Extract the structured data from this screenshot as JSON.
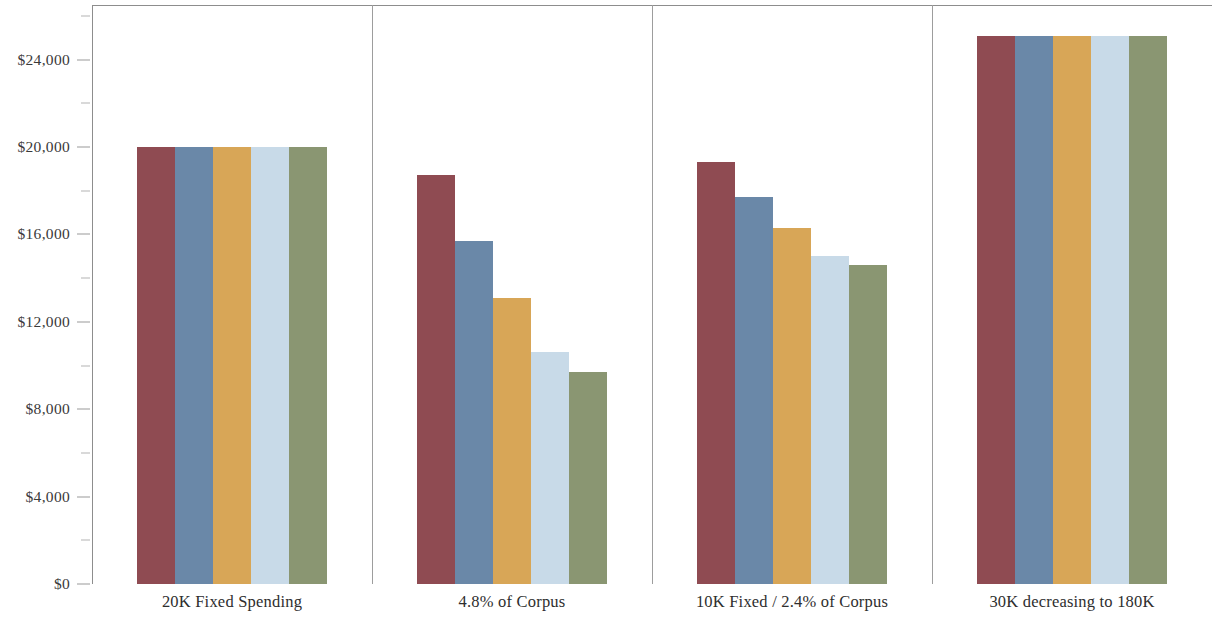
{
  "chart_data": {
    "type": "bar",
    "title": "",
    "subtitle": "",
    "xlabel": "",
    "ylabel": "",
    "categories": [
      "20K Fixed Spending",
      "4.8% of Corpus",
      "10K Fixed / 2.4% of Corpus",
      "30K decreasing to 180K"
    ],
    "series": [
      {
        "name": "Series 1",
        "color": "#8f4b52",
        "values": [
          20000,
          18700,
          19300,
          25100
        ]
      },
      {
        "name": "Series 2",
        "color": "#6a88a8",
        "values": [
          20000,
          15700,
          17700,
          25100
        ]
      },
      {
        "name": "Series 3",
        "color": "#d8a657",
        "values": [
          20000,
          13100,
          16300,
          25100
        ]
      },
      {
        "name": "Series 4",
        "color": "#c8dae8",
        "values": [
          20000,
          10600,
          15000,
          25100
        ]
      },
      {
        "name": "Series 5",
        "color": "#8a9672",
        "values": [
          20000,
          9700,
          14600,
          25100
        ]
      }
    ],
    "ylim": [
      0,
      26500
    ],
    "y_major_ticks": [
      0,
      4000,
      8000,
      12000,
      16000,
      20000,
      24000
    ],
    "y_minor_ticks": [
      2000,
      6000,
      10000,
      14000,
      18000,
      22000,
      26000
    ],
    "y_tick_labels": [
      "$0",
      "$4,000",
      "$8,000",
      "$12,000",
      "$16,000",
      "$20,000",
      "$24,000"
    ],
    "grid": false,
    "legend": "none",
    "panel_dividers": true,
    "background_color": "#ffffff",
    "axis_color": "#8d8d8d"
  }
}
